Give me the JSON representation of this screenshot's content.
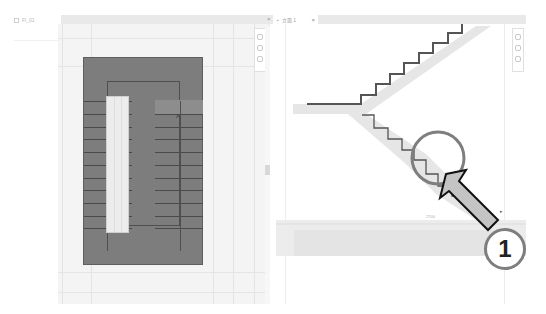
{
  "project_browser": {
    "item_label": "Fl_01"
  },
  "tabs": [
    {
      "label": "Plan view",
      "close": "×"
    },
    {
      "label": "立面 1",
      "close": "×"
    }
  ],
  "left_view": {
    "type": "floor-plan",
    "stair_fill": "#7d7d7d",
    "tread_count": 13,
    "up_arrow": "^"
  },
  "right_view": {
    "type": "section",
    "dimension_label": "2700",
    "elevation_marker": "▸"
  },
  "callout": {
    "number": "1",
    "circle_color": "#7e7e7e",
    "arrow_fill": "#c4c4c4",
    "arrow_stroke": "#111111"
  },
  "nav_icons": [
    "zoom-icon",
    "pan-icon",
    "orbit-icon"
  ]
}
